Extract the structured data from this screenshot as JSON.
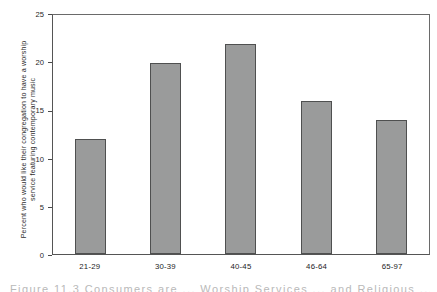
{
  "chart_data": {
    "type": "bar",
    "title": "",
    "subtitle": "",
    "categories": [
      "21-29",
      "30-39",
      "40-45",
      "46-64",
      "65-97"
    ],
    "values": [
      12,
      20,
      22,
      16,
      14
    ],
    "series": [
      {
        "name": "Percent who would like contemporary music",
        "values": [
          12,
          20,
          22,
          16,
          14
        ]
      }
    ],
    "xlabel": "",
    "ylabel": "Percent who would like their congregation to have a worship service featuring contemporary music",
    "ylabel_lines": [
      "Percent who would like their congregation to have a worship",
      "service featuring contemporary music"
    ],
    "ylim": [
      0,
      25
    ],
    "yticks": [
      0,
      5,
      10,
      15,
      20,
      25
    ],
    "ytick_labels": [
      "0",
      "5",
      "10",
      "15",
      "20",
      "25"
    ],
    "grid": false,
    "legend": false,
    "legend_position": "none",
    "bar_color": "#9a9b9b",
    "bar_edge_color": "#4f5050",
    "axis_color": "#555555",
    "background": "#ffffff"
  },
  "figure": {
    "caption_cropped": "Figure 11.3  Consumers are ... Worship Services ... and Religious ..."
  }
}
